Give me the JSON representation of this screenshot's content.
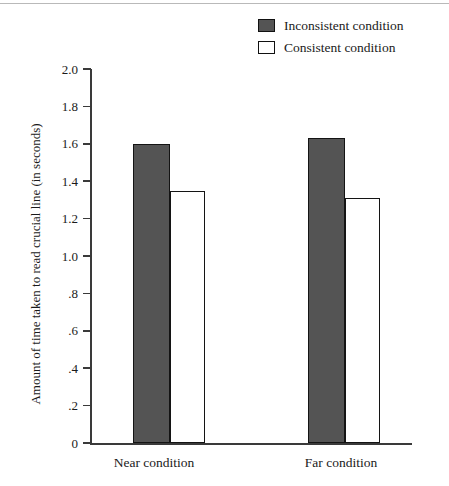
{
  "chart_data": {
    "type": "bar",
    "title": "",
    "xlabel": "",
    "ylabel": "Amount of time taken to read crucial line (in seconds)",
    "categories": [
      "Near condition",
      "Far condition"
    ],
    "series": [
      {
        "name": "Inconsistent condition",
        "values": [
          1.6,
          1.63
        ],
        "color": "#545454"
      },
      {
        "name": "Consistent condition",
        "values": [
          1.35,
          1.31
        ],
        "color": "#ffffff"
      }
    ],
    "ylim": [
      0,
      2.0
    ],
    "ytick_values": [
      2.0,
      1.8,
      1.6,
      1.4,
      1.2,
      1.0,
      0.8,
      0.6,
      0.4,
      0.2,
      0
    ],
    "ytick_labels": [
      "2.0",
      "1.8",
      "1.6",
      "1.4",
      "1.2",
      "1.0",
      ".8",
      ".6",
      ".4",
      ".2",
      "0"
    ],
    "grid": false,
    "legend_position": "top-right"
  },
  "legend": {
    "items": [
      {
        "label": "Inconsistent condition",
        "swatch": "filled-dark-gray"
      },
      {
        "label": "Consistent condition",
        "swatch": "open-white"
      }
    ]
  },
  "axes": {
    "y_title": "Amount of time taken to read crucial line (in seconds)",
    "group_labels": [
      "Near condition",
      "Far condition"
    ]
  }
}
